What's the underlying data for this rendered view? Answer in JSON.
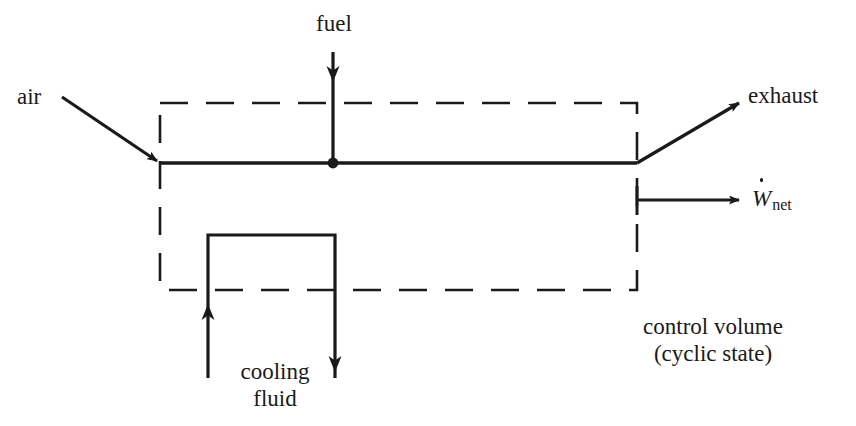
{
  "diagram": {
    "background_color": "#ffffff",
    "line_color": "#1a1a1a",
    "labels": {
      "air": "air",
      "fuel": "fuel",
      "exhaust": "exhaust",
      "work_symbol": "W",
      "work_subscript": "net",
      "cooling_line1": "cooling",
      "cooling_line2": "fluid",
      "control_volume_line1": "control volume",
      "control_volume_line2": "(cyclic state)"
    },
    "geometry": {
      "cv_box": {
        "x1": 160,
        "y1": 103,
        "x2": 637,
        "y2": 290
      },
      "main_line_y": 163,
      "fuel_x": 333,
      "junction_dot": {
        "x": 333,
        "y": 163,
        "r": 5
      },
      "cooling_left_x": 208,
      "cooling_right_x": 335,
      "cooling_top_y": 235,
      "cooling_bottom_y": 378,
      "work_arrow_y": 200,
      "work_arrow_x1": 637,
      "work_arrow_x2": 742,
      "air_arrow": {
        "x1": 62,
        "y1": 97,
        "x2": 160,
        "y2": 163
      },
      "exhaust_arrow": {
        "x1": 637,
        "y1": 163,
        "x2": 742,
        "y2": 101
      }
    },
    "dash_pattern": "28 18"
  }
}
